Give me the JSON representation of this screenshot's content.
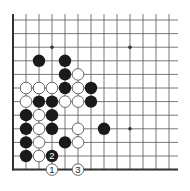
{
  "diagram": {
    "type": "go-board-fragment",
    "columns": 13,
    "rows": 12,
    "edges": [
      "left",
      "bottom"
    ],
    "star_points": [
      {
        "col": 3,
        "row": 2
      },
      {
        "col": 9,
        "row": 2
      },
      {
        "col": 9,
        "row": 8
      }
    ],
    "stones": [
      {
        "color": "black",
        "col": 2,
        "row": 3
      },
      {
        "color": "black",
        "col": 4,
        "row": 3
      },
      {
        "color": "black",
        "col": 4,
        "row": 4
      },
      {
        "color": "white",
        "col": 5,
        "row": 4
      },
      {
        "color": "white",
        "col": 1,
        "row": 5
      },
      {
        "color": "white",
        "col": 2,
        "row": 5
      },
      {
        "color": "white",
        "col": 3,
        "row": 5
      },
      {
        "color": "black",
        "col": 4,
        "row": 5
      },
      {
        "color": "white",
        "col": 5,
        "row": 5
      },
      {
        "color": "black",
        "col": 6,
        "row": 5
      },
      {
        "color": "white",
        "col": 1,
        "row": 6
      },
      {
        "color": "black",
        "col": 2,
        "row": 6
      },
      {
        "color": "black",
        "col": 3,
        "row": 6
      },
      {
        "color": "white",
        "col": 4,
        "row": 6
      },
      {
        "color": "white",
        "col": 5,
        "row": 6
      },
      {
        "color": "black",
        "col": 6,
        "row": 6
      },
      {
        "color": "black",
        "col": 1,
        "row": 7
      },
      {
        "color": "white",
        "col": 2,
        "row": 7
      },
      {
        "color": "black",
        "col": 3,
        "row": 7
      },
      {
        "color": "black",
        "col": 1,
        "row": 8
      },
      {
        "color": "white",
        "col": 2,
        "row": 8
      },
      {
        "color": "black",
        "col": 3,
        "row": 8
      },
      {
        "color": "white",
        "col": 5,
        "row": 8
      },
      {
        "color": "black",
        "col": 7,
        "row": 8
      },
      {
        "color": "black",
        "col": 1,
        "row": 9
      },
      {
        "color": "white",
        "col": 2,
        "row": 9
      },
      {
        "color": "black",
        "col": 4,
        "row": 9
      },
      {
        "color": "white",
        "col": 5,
        "row": 9
      },
      {
        "color": "black",
        "col": 1,
        "row": 10
      },
      {
        "color": "white",
        "col": 2,
        "row": 10
      },
      {
        "color": "black",
        "col": 3,
        "row": 10,
        "label": "2"
      },
      {
        "color": "white",
        "col": 3,
        "row": 11,
        "label": "1"
      },
      {
        "color": "white",
        "col": 5,
        "row": 11,
        "label": "3"
      }
    ],
    "colors": {
      "background": "#ffffff",
      "line": "#555555",
      "edge": "#333333",
      "black_stone": "#1a1a1a",
      "white_stone": "#ffffff",
      "white_stone_outline": "#444444"
    }
  }
}
